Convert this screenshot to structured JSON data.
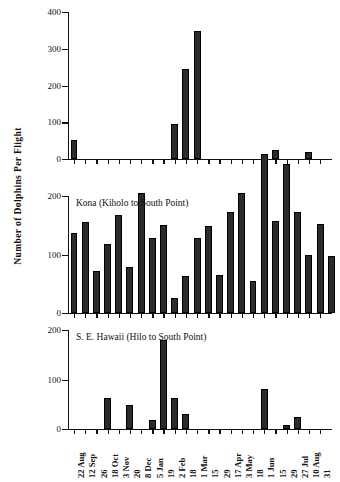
{
  "figure": {
    "y_axis_title": "Number of Dolphins Per Flight",
    "caption": ""
  },
  "chart_data": {
    "type": "bar",
    "title": "Number of Dolphins Per Flight",
    "xlabel": "",
    "ylabel": "Number of Dolphins Per Flight",
    "grid": false,
    "legend": "none",
    "x_tick_days": [
      "22",
      "12",
      "26",
      "18",
      "3",
      "20",
      "8",
      "5",
      "19",
      "2",
      "18",
      "1",
      "15",
      "29",
      "17",
      "3",
      "18",
      "1",
      "15",
      "29",
      "27",
      "10",
      "31"
    ],
    "x_tick_months": [
      "Aug",
      "Sep",
      "",
      "Oct",
      "Nov",
      "",
      "Dec",
      "Jan",
      "",
      "Feb",
      "",
      "Mar",
      "",
      "",
      "Apr",
      "May",
      "",
      "Jun",
      "",
      "",
      "Jul",
      "Aug",
      ""
    ],
    "categories": [
      "Aug 22",
      "Sep 12",
      "Sep 26",
      "Oct 18",
      "Nov 3",
      "Nov 20",
      "Dec 8",
      "Jan 5",
      "Jan 19",
      "Feb 2",
      "Feb 18",
      "Mar 1",
      "Mar 15",
      "Mar 29",
      "Apr 17",
      "May 3",
      "May 18",
      "Jun 1",
      "Jun 15",
      "Jun 29",
      "Jul 27",
      "Aug 10",
      "Aug 31"
    ],
    "panels": [
      {
        "name": "panel-top",
        "label": "",
        "ylim": [
          0,
          400
        ],
        "yticks": [
          0,
          100,
          200,
          300,
          400
        ],
        "values": [
          52,
          0,
          0,
          0,
          0,
          0,
          0,
          0,
          0,
          95,
          245,
          348,
          0,
          0,
          0,
          0,
          0,
          0,
          25,
          0,
          0,
          18,
          0
        ]
      },
      {
        "name": "panel-kona",
        "label": "Kona (Kiholo to South Point)",
        "ylim": [
          0,
          200
        ],
        "yticks": [
          0,
          100,
          200
        ],
        "values": [
          136,
          155,
          72,
          118,
          168,
          78,
          205,
          128,
          150,
          25,
          63,
          128,
          148,
          65,
          172,
          205,
          55,
          272,
          158,
          255,
          172,
          100,
          152,
          97
        ]
      },
      {
        "name": "panel-se-hawaii",
        "label": "S. E. Hawaii (Hilo to South Point)",
        "ylim": [
          0,
          200
        ],
        "yticks": [
          0,
          100,
          200
        ],
        "values": [
          0,
          0,
          0,
          62,
          0,
          48,
          0,
          18,
          180,
          62,
          30,
          0,
          0,
          0,
          0,
          0,
          0,
          80,
          0,
          8,
          25,
          0,
          0
        ]
      }
    ]
  }
}
